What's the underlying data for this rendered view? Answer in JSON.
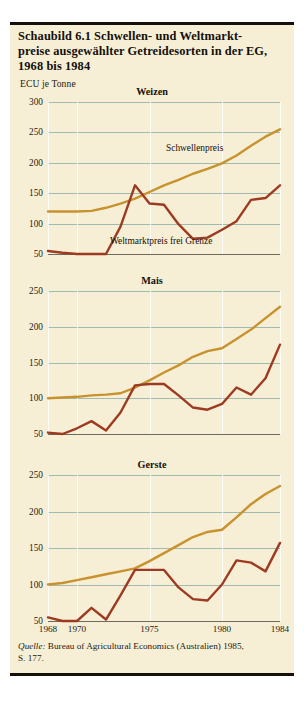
{
  "figure": {
    "title_lines": [
      "Schaubild 6.1   Schwellen- und Weltmarkt-",
      "preise ausgewählter Getreidesorten in der EG,",
      "1968 bis 1984"
    ],
    "axis_unit": "ECU je Tonne",
    "source_prefix": "Quelle:",
    "source_text": " Bureau of Agricultural Economics (Australien) 1985,",
    "source_line2": "S. 177.",
    "colors": {
      "background": "#f7efd5",
      "gridline": "#8fb2a8",
      "threshold_price": "#c8922e",
      "world_market_price": "#9c3b22",
      "text": "#14100c"
    },
    "series_labels": {
      "threshold": "Schwellenpreis",
      "world_market": "Weltmarktpreis frei Grenze"
    }
  },
  "chart_data": [
    {
      "type": "line",
      "title": "Weizen",
      "xlabel": "",
      "ylabel": "ECU je Tonne",
      "ylim": [
        50,
        300
      ],
      "yticks": [
        300,
        250,
        200,
        150,
        100,
        50
      ],
      "xlim": [
        1968,
        1984
      ],
      "xticks": [
        1968,
        1970,
        1975,
        1980,
        1984
      ],
      "grid": true,
      "legend": "inline-annotation",
      "x": [
        1968,
        1969,
        1970,
        1971,
        1972,
        1973,
        1974,
        1975,
        1976,
        1977,
        1978,
        1979,
        1980,
        1981,
        1982,
        1983,
        1984
      ],
      "series": [
        {
          "name": "Schwellenpreis",
          "color": "#c8922e",
          "values": [
            120,
            120,
            120,
            121,
            126,
            133,
            141,
            152,
            163,
            172,
            182,
            190,
            199,
            212,
            228,
            243,
            255
          ]
        },
        {
          "name": "Weltmarktpreis frei Grenze",
          "color": "#9c3b22",
          "values": [
            55,
            52,
            45,
            48,
            46,
            95,
            163,
            133,
            131,
            99,
            75,
            77,
            90,
            104,
            139,
            142,
            163
          ]
        }
      ]
    },
    {
      "type": "line",
      "title": "Mais",
      "xlabel": "",
      "ylabel": "ECU je Tonne",
      "ylim": [
        50,
        250
      ],
      "yticks": [
        250,
        200,
        150,
        100,
        50
      ],
      "xlim": [
        1968,
        1984
      ],
      "xticks": [
        1968,
        1970,
        1975,
        1980,
        1984
      ],
      "grid": true,
      "legend": "none",
      "x": [
        1968,
        1969,
        1970,
        1971,
        1972,
        1973,
        1974,
        1975,
        1976,
        1977,
        1978,
        1979,
        1980,
        1981,
        1982,
        1983,
        1984
      ],
      "series": [
        {
          "name": "Schwellenpreis",
          "color": "#c8922e",
          "values": [
            100,
            101,
            102,
            104,
            105,
            107,
            115,
            125,
            136,
            146,
            158,
            166,
            170,
            183,
            196,
            212,
            228
          ]
        },
        {
          "name": "Weltmarktpreis frei Grenze",
          "color": "#9c3b22",
          "values": [
            52,
            50,
            58,
            68,
            55,
            80,
            118,
            120,
            120,
            104,
            87,
            84,
            92,
            115,
            105,
            128,
            175
          ]
        }
      ]
    },
    {
      "type": "line",
      "title": "Gerste",
      "xlabel": "",
      "ylabel": "ECU je Tonne",
      "ylim": [
        50,
        250
      ],
      "yticks": [
        250,
        200,
        150,
        100,
        50
      ],
      "xlim": [
        1968,
        1984
      ],
      "xticks": [
        1968,
        1970,
        1975,
        1980,
        1984
      ],
      "grid": true,
      "legend": "none",
      "x": [
        1968,
        1969,
        1970,
        1971,
        1972,
        1973,
        1974,
        1975,
        1976,
        1977,
        1978,
        1979,
        1980,
        1981,
        1982,
        1983,
        1984
      ],
      "series": [
        {
          "name": "Schwellenpreis",
          "color": "#c8922e",
          "values": [
            100,
            102,
            106,
            110,
            114,
            118,
            122,
            132,
            143,
            154,
            165,
            172,
            175,
            192,
            210,
            224,
            235
          ]
        },
        {
          "name": "Weltmarktpreis frei Grenze",
          "color": "#9c3b22",
          "values": [
            55,
            48,
            47,
            68,
            52,
            85,
            120,
            120,
            120,
            96,
            80,
            78,
            100,
            133,
            130,
            118,
            157
          ]
        }
      ]
    }
  ]
}
